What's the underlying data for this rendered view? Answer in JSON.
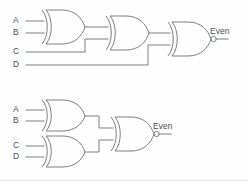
{
  "figure": {
    "background_color": "#fefefe",
    "line_color": "#6b6f72",
    "text_color": "#4a4f52"
  },
  "circuits": [
    {
      "id": "cascade-chain",
      "name": "Cascaded XOR chain with XNOR output",
      "inputs": [
        {
          "label": "A"
        },
        {
          "label": "B"
        },
        {
          "label": "C"
        },
        {
          "label": "D"
        }
      ],
      "gates": [
        {
          "id": "g1",
          "type": "XOR",
          "inputs": [
            "A",
            "B"
          ]
        },
        {
          "id": "g2",
          "type": "XOR",
          "inputs": [
            "g1",
            "C"
          ]
        },
        {
          "id": "g3",
          "type": "XNOR",
          "inputs": [
            "g2",
            "D"
          ]
        }
      ],
      "output": {
        "label": "Even",
        "from": "g3"
      }
    },
    {
      "id": "tree-chain",
      "name": "Tree of XOR gates with XNOR output",
      "inputs": [
        {
          "label": "A"
        },
        {
          "label": "B"
        },
        {
          "label": "C"
        },
        {
          "label": "D"
        }
      ],
      "gates": [
        {
          "id": "h1",
          "type": "XOR",
          "inputs": [
            "A",
            "B"
          ]
        },
        {
          "id": "h2",
          "type": "XOR",
          "inputs": [
            "C",
            "D"
          ]
        },
        {
          "id": "h3",
          "type": "XNOR",
          "inputs": [
            "h1",
            "h2"
          ]
        }
      ],
      "output": {
        "label": "Even",
        "from": "h3"
      }
    }
  ],
  "labels": {
    "top": {
      "in_a": "A",
      "in_b": "B",
      "in_c": "C",
      "in_d": "D",
      "out": "Even"
    },
    "bottom": {
      "in_a": "A",
      "in_b": "B",
      "in_c": "C",
      "in_d": "D",
      "out": "Even"
    }
  }
}
